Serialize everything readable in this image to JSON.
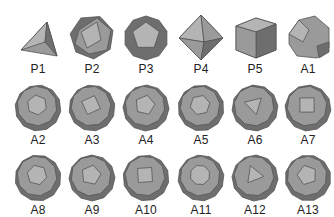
{
  "figure": {
    "rows": [
      {
        "items": [
          {
            "label": "P1",
            "kind": "tetrahedron"
          },
          {
            "label": "P2",
            "kind": "icosahedron"
          },
          {
            "label": "P3",
            "kind": "dodecahedron"
          },
          {
            "label": "P4",
            "kind": "octahedron"
          },
          {
            "label": "P5",
            "kind": "cube"
          },
          {
            "label": "A1",
            "kind": "truncated-tetrahedron"
          }
        ]
      },
      {
        "items": [
          {
            "label": "A2",
            "kind": "archimedean-solid"
          },
          {
            "label": "A3",
            "kind": "archimedean-solid"
          },
          {
            "label": "A4",
            "kind": "archimedean-solid"
          },
          {
            "label": "A5",
            "kind": "archimedean-solid"
          },
          {
            "label": "A6",
            "kind": "archimedean-solid"
          },
          {
            "label": "A7",
            "kind": "archimedean-solid"
          }
        ]
      },
      {
        "items": [
          {
            "label": "A8",
            "kind": "archimedean-solid"
          },
          {
            "label": "A9",
            "kind": "archimedean-solid"
          },
          {
            "label": "A10",
            "kind": "archimedean-solid"
          },
          {
            "label": "A11",
            "kind": "archimedean-solid"
          },
          {
            "label": "A12",
            "kind": "archimedean-solid"
          },
          {
            "label": "A13",
            "kind": "archimedean-solid"
          }
        ]
      }
    ],
    "colors": {
      "face_light": "#b4b4b4",
      "face_mid": "#9a9a9a",
      "face_dark": "#6e6e6e",
      "edge": "#555555",
      "label": "#222222"
    }
  }
}
